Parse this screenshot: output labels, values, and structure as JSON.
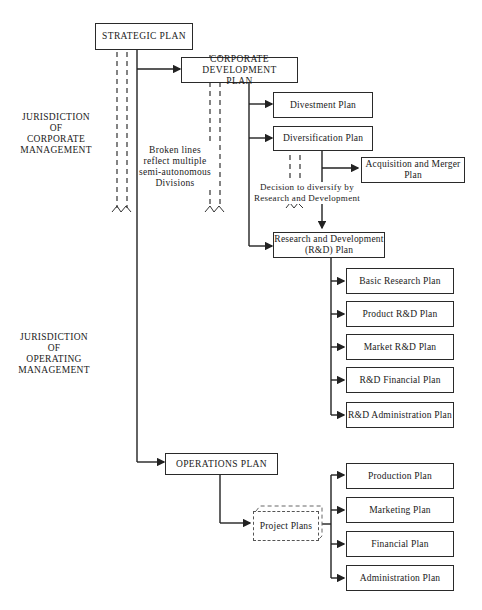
{
  "diagram": {
    "nodes": {
      "strategic": "STRATEGIC PLAN",
      "corporate_dev_1": "CORPORATE DEVELOPMENT",
      "corporate_dev_2": "PLAN",
      "divestment": "Divestment Plan",
      "diversification": "Diversification Plan",
      "acquisition_1": "Acquisition and Merger",
      "acquisition_2": "Plan",
      "rd_1": "Research and Development",
      "rd_2": "(R&D) Plan",
      "basic_research": "Basic Research Plan",
      "product_rd": "Product R&D Plan",
      "market_rd": "Market R&D Plan",
      "rd_financial": "R&D Financial Plan",
      "rd_admin": "R&D Administration Plan",
      "operations": "OPERATIONS PLAN",
      "project_plans": "Project Plans",
      "production": "Production Plan",
      "marketing": "Marketing Plan",
      "financial": "Financial Plan",
      "administration": "Administration Plan"
    },
    "annotations": {
      "corporate_jurisdiction": [
        "JURISDICTION",
        "OF",
        "CORPORATE",
        "MANAGEMENT"
      ],
      "operating_jurisdiction": [
        "JURISDICTION",
        "OF",
        "OPERATING",
        "MANAGEMENT"
      ],
      "broken_lines": [
        "Broken lines",
        "reflect multiple",
        "semi-autonomous",
        "Divisions"
      ],
      "decision": [
        "Decision to diversify by",
        "Research and Development"
      ]
    }
  }
}
